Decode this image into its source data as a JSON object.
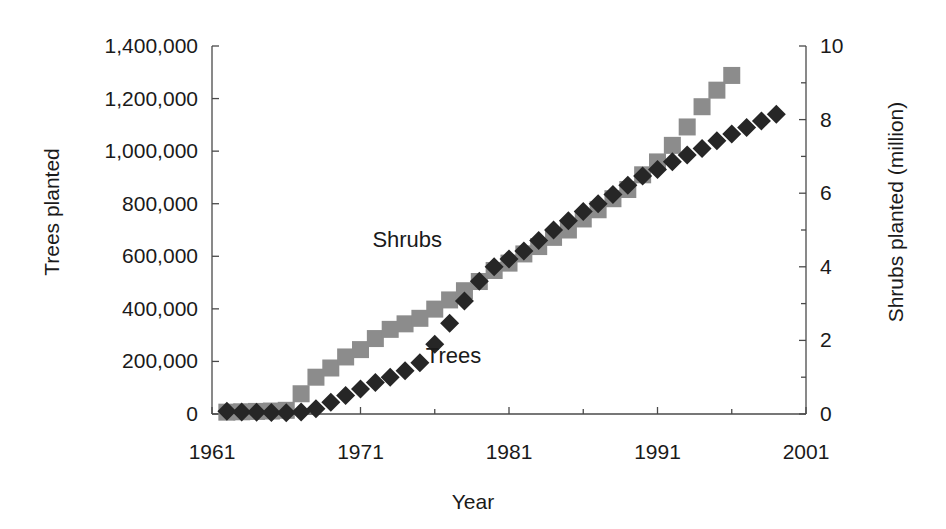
{
  "chart_data": {
    "type": "scatter",
    "title": "",
    "xlabel": "Year",
    "ylabel": "Trees planted",
    "ylabel_right": "Shrubs planted (million)",
    "xlim": [
      1961,
      2001
    ],
    "ylim": [
      0,
      1400000
    ],
    "ylim_right": [
      0,
      10
    ],
    "grid": false,
    "legend_position": "inline-annotation",
    "x_ticks": [
      "1961",
      "1971",
      "1981",
      "1991",
      "2001"
    ],
    "x_tick_values": [
      1961,
      1971,
      1981,
      1991,
      2001
    ],
    "x_minor_tick_values": [
      1966,
      1976,
      1986,
      1996
    ],
    "y_ticks_left": [
      "0",
      "200,000",
      "400,000",
      "600,000",
      "800,000",
      "1,000,000",
      "1,200,000",
      "1,400,000"
    ],
    "y_tick_values_left": [
      0,
      200000,
      400000,
      600000,
      800000,
      1000000,
      1200000,
      1400000
    ],
    "y_ticks_right": [
      "0",
      "2",
      "4",
      "6",
      "8",
      "10"
    ],
    "y_tick_values_right": [
      0,
      2,
      4,
      6,
      8,
      10
    ],
    "y_minor_tick_values_right": [
      1,
      3,
      5,
      7,
      9
    ],
    "annotations": [
      {
        "text": "Shrubs",
        "x": 1971.8,
        "y": 660000
      },
      {
        "text": "Trees",
        "x": 1975.4,
        "y": 215000
      }
    ],
    "series": [
      {
        "name": "Shrubs",
        "axis": "right",
        "marker": "square",
        "color": "#8c8c8c",
        "unit": "million shrubs",
        "x": [
          1962,
          1963,
          1964,
          1965,
          1966,
          1967,
          1968,
          1969,
          1970,
          1971,
          1972,
          1973,
          1974,
          1975,
          1976,
          1977,
          1978,
          1979,
          1980,
          1981,
          1982,
          1983,
          1984,
          1985,
          1986,
          1987,
          1988,
          1989,
          1990,
          1991,
          1992,
          1993,
          1994,
          1995,
          1996
        ],
        "values": [
          0.05,
          0.06,
          0.07,
          0.08,
          0.1,
          0.55,
          1.0,
          1.25,
          1.55,
          1.75,
          2.05,
          2.3,
          2.45,
          2.6,
          2.85,
          3.1,
          3.35,
          3.6,
          3.9,
          4.1,
          4.35,
          4.55,
          4.8,
          5.0,
          5.3,
          5.55,
          5.85,
          6.1,
          6.5,
          6.85,
          7.3,
          7.8,
          8.35,
          8.8,
          9.2
        ]
      },
      {
        "name": "Trees",
        "axis": "left",
        "marker": "diamond",
        "color": "#262626",
        "unit": "trees",
        "x": [
          1962,
          1963,
          1964,
          1965,
          1966,
          1967,
          1968,
          1969,
          1970,
          1971,
          1972,
          1973,
          1974,
          1975,
          1976,
          1977,
          1978,
          1979,
          1980,
          1981,
          1982,
          1983,
          1984,
          1985,
          1986,
          1987,
          1988,
          1989,
          1990,
          1991,
          1992,
          1993,
          1994,
          1995,
          1996,
          1997,
          1998,
          1999
        ],
        "values": [
          10000,
          8000,
          7000,
          6000,
          5000,
          8000,
          20000,
          45000,
          70000,
          95000,
          120000,
          140000,
          165000,
          195000,
          265000,
          345000,
          430000,
          505000,
          560000,
          590000,
          620000,
          660000,
          700000,
          735000,
          770000,
          800000,
          835000,
          870000,
          905000,
          930000,
          960000,
          985000,
          1010000,
          1040000,
          1065000,
          1090000,
          1115000,
          1140000
        ]
      }
    ]
  },
  "axes": {
    "left_title": "Trees planted",
    "right_title": "Shrubs planted (million)",
    "x_title": "Year"
  }
}
